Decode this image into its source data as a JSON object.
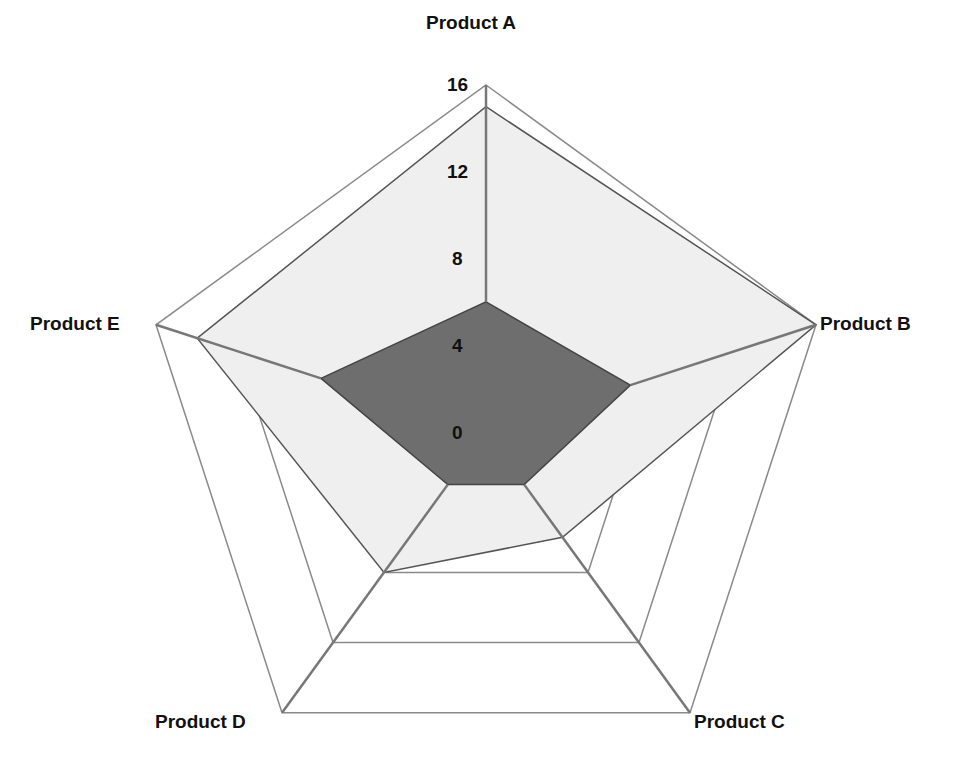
{
  "chart_data": {
    "type": "radar",
    "title": "",
    "categories": [
      "Product A",
      "Product B",
      "Product C",
      "Product D",
      "Product E"
    ],
    "series": [
      {
        "name": "Series 1",
        "values": [
          15,
          16,
          6,
          8,
          14
        ],
        "fill": "#efefef",
        "stroke": "#555555"
      },
      {
        "name": "Series 2",
        "values": [
          6,
          7,
          3,
          3,
          8
        ],
        "fill": "#6e6e6e",
        "stroke": "#444444"
      }
    ],
    "radial_ticks": [
      "0",
      "4",
      "8",
      "12",
      "16"
    ],
    "rlim": [
      0,
      16
    ],
    "grid": true,
    "legend": "none"
  },
  "labels": {
    "product_a": "Product A",
    "product_b": "Product B",
    "product_c": "Product C",
    "product_d": "Product D",
    "product_e": "Product E"
  },
  "ticks": {
    "t0": "0",
    "t4": "4",
    "t8": "8",
    "t12": "12",
    "t16": "16"
  },
  "colors": {
    "grid": "#8a8a8a",
    "light_fill": "#efefef",
    "dark_fill": "#6e6e6e",
    "spoke": "#777777"
  }
}
